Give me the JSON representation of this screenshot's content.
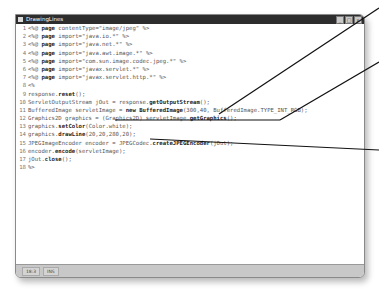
{
  "window": {
    "title": "DrawingLines",
    "controls": [
      "_",
      "□",
      "x"
    ]
  },
  "editor": {
    "lines": [
      {
        "n": "1",
        "pre": "<%@ ",
        "kw": "page",
        "post": " contentType=\"image/jpeg\" %>"
      },
      {
        "n": "2",
        "pre": "<%@ ",
        "kw": "page",
        "post": " import=\"java.io.*\" %>"
      },
      {
        "n": "3",
        "pre": "<%@ ",
        "kw": "page",
        "post": " import=\"java.net.*\" %>"
      },
      {
        "n": "4",
        "pre": "<%@ ",
        "kw": "page",
        "post": " import=\"java.awt.image.*\" %>"
      },
      {
        "n": "5",
        "pre": "<%@ ",
        "kw": "page",
        "post": " import=\"com.sun.image.codec.jpeg.*\" %>"
      },
      {
        "n": "6",
        "pre": "<%@ ",
        "kw": "page",
        "post": " import=\"javax.servlet.*\" %>"
      },
      {
        "n": "7",
        "pre": "<%@ ",
        "kw": "page",
        "post": " import=\"javax.servlet.http.*\" %>"
      },
      {
        "n": "8",
        "pre": "<%",
        "kw": "",
        "post": ""
      },
      {
        "n": "9",
        "pre": "response.",
        "kw": "reset",
        "post": "();"
      },
      {
        "n": "10",
        "pre": "ServletOutputStream jOut = response.",
        "kw": "getOutputStream",
        "post": "();"
      },
      {
        "n": "11",
        "pre": "BufferedImage servletImage = ",
        "kw": "new BufferedImage",
        "post": "(300,40, BufferedImage.TYPE_INT_RGB);"
      },
      {
        "n": "12",
        "pre": "Graphics2D graphics = (Graphics2D) servletImage.",
        "kw": "getGraphics",
        "post": "();"
      },
      {
        "n": "13",
        "pre": "graphics.",
        "kw": "setColor",
        "post": "(Color.white);"
      },
      {
        "n": "14",
        "pre": "graphics.",
        "kw": "drawLine",
        "post": "(20,20,280,20);"
      },
      {
        "n": "15",
        "pre": "JPEGImageEncoder encoder = JPEGCodec.",
        "kw": "createJPEGEncoder",
        "post": "(jOut);"
      },
      {
        "n": "16",
        "pre": "encoder.",
        "kw": "encode",
        "post": "(servletImage);"
      },
      {
        "n": "17",
        "pre": "jOut.",
        "kw": "close",
        "post": "();"
      },
      {
        "n": "18",
        "pre": "%>",
        "kw": "",
        "post": ""
      }
    ]
  },
  "statusbar": {
    "position": "18:3",
    "mode": "INS"
  },
  "colors": {
    "titlebar": "#2d2d2d",
    "statusbar": "#c8c8c8",
    "annotation_line": "#111111"
  }
}
